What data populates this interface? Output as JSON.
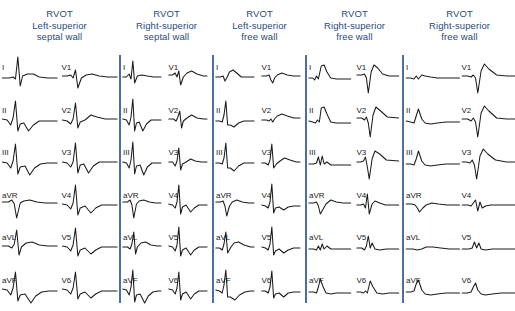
{
  "figure": {
    "type": "ecg-12-lead-comparison",
    "panel_count": 5,
    "divider_color": "#4a6fa5",
    "header_color": "#2a4a7c",
    "trace_color": "#1c1c1c",
    "background_color": "#ffffff"
  },
  "leads": {
    "limb": [
      "I",
      "II",
      "III",
      "aVR",
      "aVL",
      "aVF"
    ],
    "precordial": [
      "V1",
      "V2",
      "V3",
      "V4",
      "V5",
      "V6"
    ],
    "order": [
      "I",
      "V1",
      "II",
      "V2",
      "III",
      "V3",
      "aVR",
      "V4",
      "aVL",
      "V5",
      "aVF",
      "V6"
    ]
  },
  "panels": [
    {
      "id": "panel-1",
      "title": "RVOT",
      "site_line1": "Left-superior",
      "site_line2": "septal wall",
      "x": 0,
      "width": 119,
      "lead_labels": {
        "I": "I",
        "II": "II",
        "III": "III",
        "aVR": "aVR",
        "aVL": "aVL",
        "aVF": "aVF",
        "V1": "V1",
        "V2": "V2",
        "V3": "V3",
        "V4": "V4",
        "V5": "V5",
        "V6": "V6"
      },
      "traces": {
        "I": "M2,26 L8,26 L11,25 L13,27 L15,5 L17,34 L19,24 L23,22 L28,22 L33,25 L40,26 L48,26",
        "II": "M2,24 L6,25 L9,30 L11,23 L13,6 L15,36 L17,29 L20,28 L24,36 L28,30 L33,26 L40,26 L48,26",
        "III": "M2,25 L6,26 L9,31 L11,24 L13,7 L15,37 L17,30 L21,29 L25,38 L29,31 L34,27 L40,26 L48,26",
        "aVR": "M2,22 L7,22 L10,20 L12,24 L14,38 L17,23 L20,21 L25,20 L31,22 L38,23 L48,23",
        "aVL": "M2,24 L7,24 L10,26 L12,22 L14,8 L16,33 L18,25 L22,21 L27,20 L33,23 L40,24 L48,24",
        "aVF": "M2,24 L6,25 L9,30 L11,23 L13,7 L15,36 L17,30 L21,29 L26,38 L30,31 L35,27 L41,26 L48,26",
        "V1": "M2,24 L6,24 L9,23 L11,26 L13,18 L15,36 L18,26 L22,23 L27,22 L33,24 L40,25 L48,25",
        "V2": "M2,25 L6,26 L9,29 L11,24 L13,8 L15,33 L17,27 L21,25 L26,20 L31,22 L38,24 L48,24",
        "V3": "M2,25 L6,26 L9,30 L11,25 L13,6 L15,36 L17,28 L20,27 L24,36 L28,29 L33,25 L40,25 L48,25",
        "V4": "M2,24 L6,25 L9,29 L11,23 L13,5 L15,35 L17,28 L21,26 L26,33 L30,28 L35,25 L41,25 L48,25",
        "V5": "M2,24 L6,25 L9,29 L11,23 L13,6 L15,34 L17,28 L21,26 L26,32 L30,28 L35,25 L41,25 L48,25",
        "V6": "M2,24 L6,25 L9,29 L11,23 L13,7 L15,34 L17,29 L21,27 L26,33 L30,29 L35,26 L41,26 L48,26"
      }
    },
    {
      "id": "panel-2",
      "title": "RVOT",
      "site_line1": "Right-superior",
      "site_line2": "septal wall",
      "x": 121,
      "width": 91,
      "lead_labels": {
        "I": "I",
        "II": "II",
        "III": "III",
        "aVR": "aVR",
        "aVL": "aVL",
        "aVF": "aVF",
        "V1": "V1",
        "V2": "V2",
        "V3": "V3",
        "V4": "V4",
        "V5": "V5",
        "V6": "V6"
      },
      "traces": {
        "I": "M2,25 L6,25 L9,22 L11,27 L13,9 L15,31 L18,24 L23,23 L29,24 L36,25 L44,25",
        "II": "M2,24 L6,25 L9,30 L11,22 L13,4 L15,36 L17,28 L20,27 L24,36 L28,29 L33,25 L39,25 L44,25",
        "III": "M2,25 L6,26 L9,31 L11,23 L13,5 L15,37 L17,29 L21,28 L25,38 L29,30 L34,26 L40,26 L44,26",
        "aVR": "M2,22 L7,22 L10,20 L12,25 L14,38 L17,24 L20,21 L25,20 L31,22 L38,23 L44,23",
        "aVL": "M2,25 L7,25 L10,27 L12,22 L14,10 L16,32 L18,25 L22,21 L27,20 L33,23 L40,24 L44,24",
        "aVF": "M2,24 L6,25 L9,30 L11,22 L13,5 L15,37 L17,30 L21,29 L26,38 L30,31 L35,27 L41,26 L44,26",
        "V1": "M2,23 L6,23 L9,21 L11,25 L13,19 L15,33 L18,25 L22,21 L27,19 L33,22 L40,24 L44,24",
        "V2": "M2,24 L7,24 L10,26 L12,22 L14,16 L16,33 L18,26 L22,23 L27,20 L33,23 L40,24 L44,24",
        "V3": "M2,25 L6,25 L9,29 L11,24 L13,11 L15,33 L17,27 L21,25 L26,22 L31,24 L38,25 L44,25",
        "V4": "M2,24 L6,25 L9,28 L11,22 L13,5 L15,34 L17,27 L21,25 L26,32 L30,28 L35,25 L41,25 L44,25",
        "V5": "M2,24 L6,25 L9,29 L11,23 L13,5 L15,34 L17,28 L21,26 L26,33 L30,28 L35,25 L41,25 L44,25",
        "V6": "M2,24 L6,25 L9,29 L11,23 L13,7 L15,35 L17,29 L21,27 L26,34 L30,29 L35,26 L41,26 L44,26"
      }
    },
    {
      "id": "panel-3",
      "title": "RVOT",
      "site_line1": "Left-superior",
      "site_line2": "free wall",
      "x": 214,
      "width": 91,
      "lead_labels": {
        "I": "I",
        "II": "II",
        "III": "III",
        "aVR": "aVR",
        "aVL": "aVL",
        "aVF": "aVF",
        "V1": "V1",
        "V2": "V2",
        "V3": "V3",
        "V4": "V4",
        "V5": "V5",
        "V6": "V6"
      },
      "traces": {
        "I": "M2,25 L7,25 L10,24 L12,29 L14,26 L17,20 L21,18 L25,21 L30,25 L37,25 L44,25",
        "II": "M2,26 L6,26 L9,27 L11,20 L13,6 L15,30 L18,30 L22,32 L27,28 L33,26 L39,26 L44,26",
        "III": "M2,26 L6,26 L9,27 L11,21 L13,6 L15,31 L18,31 L22,34 L27,29 L33,26 L39,26 L44,26",
        "aVR": "M2,22 L7,22 L10,21 L12,26 L14,36 L17,26 L20,22 L25,20 L31,22 L38,23 L44,23",
        "aVL": "M2,26 L6,26 L9,28 L11,22 L13,10 L15,31 L18,26 L22,21 L27,20 L33,23 L40,25 L44,25",
        "aVF": "M2,25 L6,26 L9,28 L11,20 L13,5 L15,32 L18,32 L23,35 L28,30 L34,27 L40,26 L44,26",
        "V1": "M2,24 L7,24 L10,23 L12,28 L14,31 L16,26 L19,23 L24,21 L30,23 L37,24 L44,24",
        "V2": "M2,25 L7,25 L10,26 L12,24 L14,27 L16,24 L19,21 L24,19 L30,21 L37,23 L44,23",
        "V3": "M2,26 L6,26 L9,28 L11,23 L13,7 L15,31 L18,27 L22,24 L27,21 L33,23 L40,25 L44,25",
        "V4": "M2,25 L6,26 L9,28 L11,22 L13,4 L15,33 L17,28 L21,27 L26,30 L31,27 L37,26 L44,26",
        "V5": "M2,25 L6,26 L9,28 L11,22 L13,5 L15,33 L17,29 L21,27 L26,31 L31,28 L37,26 L44,26",
        "V6": "M2,26 L6,26 L9,28 L11,22 L13,6 L15,33 L17,29 L21,28 L26,32 L31,28 L37,27 L44,27"
      }
    },
    {
      "id": "panel-4",
      "title": "RVOT",
      "site_line1": "Right-superior",
      "site_line2": "free wall",
      "x": 307,
      "width": 95,
      "lead_labels": {
        "I": "I",
        "II": "II",
        "III": "III",
        "aVR": "aVR",
        "aVL": "aVL",
        "aVF": "aVF",
        "V1": "V1",
        "V2": "V2",
        "V3": "V3",
        "V4": "V4",
        "V5": "V5",
        "V6": "V6"
      },
      "traces": {
        "I": "M2,26 L6,26 L8,28 L10,24 L12,27 L15,14 L18,13 L21,20 L25,26 L31,27 L38,27 L46,27",
        "II": "M2,26 L6,27 L9,28 L11,25 L13,27 L15,13 L18,12 L21,19 L25,27 L31,28 L38,28 L46,28",
        "III": "M2,27 L7,27 L10,26 L12,20 L14,28 L16,19 L18,27 L21,25 L25,28 L31,28 L38,28 L46,28",
        "V1": "M2,23 L7,23 L10,22 L12,26 L14,41 L17,20 L20,13 L24,16 L29,22 L36,24 L46,24",
        "V2": "M2,23 L7,23 L10,25 L12,22 L14,28 L16,42 L19,20 L22,12 L27,16 L34,22 L46,23",
        "V3": "M2,25 L6,25 L9,24 L11,20 L13,30 L15,42 L18,22 L21,14 L26,17 L33,23 L46,24",
        "aVR": "M2,23 L7,23 L10,22 L12,26 L14,34 L17,29 L20,24 L25,20 L31,22 L38,23 L46,23",
        "aVL": "M2,27 L7,27 L10,28 L12,24 L14,28 L16,22 L18,27 L21,24 L25,27 L31,27 L38,27 L46,27",
        "aVF": "M2,27 L7,27 L10,28 L12,22 L14,14 L17,22 L20,28 L25,29 L31,28 L38,28 L46,28",
        "V4": "M2,25 L6,25 L9,24 L11,28 L13,14 L15,34 L18,24 L21,21 L26,23 L32,25 L40,25 L46,25",
        "V5": "M2,26 L7,26 L10,28 L12,24 L14,14 L16,26 L18,21 L21,27 L26,28 L33,27 L40,27 L46,27",
        "V6": "M2,27 L6,27 L9,28 L11,26 L13,28 L16,16 L19,22 L23,28 L29,29 L36,28 L46,28"
      }
    },
    {
      "id": "panel-5",
      "title": "RVOT",
      "site_line1": "Right-superior",
      "site_line2": "free wall",
      "x": 404,
      "width": 111,
      "lead_labels": {
        "I": "I",
        "II": "II",
        "III": "III",
        "aVR": "aVR",
        "aVL": "aVL",
        "aVF": "aVF",
        "V1": "V1",
        "V2": "V2",
        "V3": "V3",
        "V4": "V4",
        "V5": "V5",
        "V6": "V6"
      },
      "traces": {
        "I": "M2,26 L6,26 L9,27 L11,24 L13,27 L16,23 L19,24 L24,25 L30,26 L38,26 L50,26",
        "II": "M2,26 L6,27 L9,28 L11,21 L13,14 L16,24 L19,28 L24,29 L30,28 L38,27 L50,27",
        "III": "M2,27 L6,27 L9,28 L11,22 L13,14 L16,24 L19,28 L24,29 L30,28 L38,27 L50,27",
        "aVR": "M2,24 L7,24 L10,25 L12,28 L14,32 L17,28 L20,25 L25,23 L31,24 L39,25 L50,25",
        "aVL": "M2,27 L8,27 L12,28 L16,27 L20,25 L26,25 L33,26 L41,27 L50,27",
        "aVF": "M2,27 L6,27 L9,26 L11,19 L13,15 L16,25 L19,29 L24,30 L30,29 L38,28 L50,28",
        "V1": "M2,24 L7,24 L10,25 L12,23 L14,26 L16,41 L19,19 L22,12 L26,17 L33,23 L42,24 L50,24",
        "V2": "M2,24 L7,24 L10,26 L12,23 L14,27 L16,42 L19,18 L22,11 L26,16 L33,23 L42,24 L50,24",
        "V3": "M2,25 L6,25 L9,26 L11,23 L13,28 L15,42 L18,19 L21,12 L25,17 L32,23 L42,25 L50,25",
        "V4": "M2,25 L7,25 L10,26 L12,23 L14,20 L16,31 L18,22 L20,28 L23,26 L28,25 L35,25 L50,25",
        "V5": "M2,27 L8,27 L11,26 L13,20 L15,26 L17,21 L19,27 L23,28 L29,27 L37,27 L50,27",
        "V6": "M2,28 L7,28 L10,27 L12,22 L14,18 L16,25 L19,29 L23,30 L29,29 L37,28 L50,28"
      }
    }
  ]
}
